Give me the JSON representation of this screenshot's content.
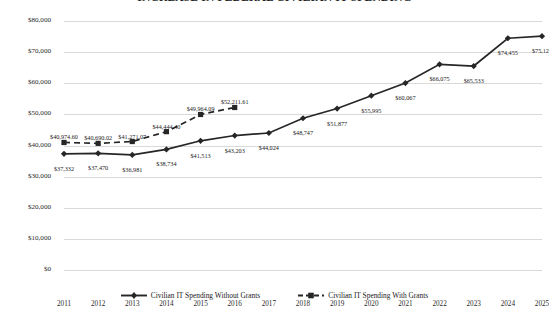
{
  "chart_data": {
    "type": "line",
    "title": "INCREASE IN FEDERAL CIVILIAN IT SPENDING",
    "xlabel": "",
    "ylabel": "",
    "grid": true,
    "legend_position": "bottom",
    "ylim": [
      0,
      80000
    ],
    "ytick_labels": [
      "$80,000",
      "$70,000",
      "$60,000",
      "$50,000",
      "$40,000",
      "$30,000",
      "$20,000",
      "$10,000",
      "$0"
    ],
    "ytick_values": [
      80000,
      70000,
      60000,
      50000,
      40000,
      30000,
      20000,
      10000,
      0
    ],
    "categories": [
      "2011",
      "2012",
      "2013",
      "2014",
      "2015",
      "2016",
      "2017",
      "2018",
      "2019",
      "2020",
      "2021",
      "2022",
      "2023",
      "2024",
      "2025"
    ],
    "series": [
      {
        "name": "Civilian IT Spending Without Grants",
        "style": "solid",
        "marker": "diamond",
        "color": "#262626",
        "values": [
          37332,
          37470,
          36981,
          38734,
          41513,
          43203,
          44024,
          48747,
          51877,
          55995,
          60067,
          66075,
          65533,
          74455,
          75128
        ],
        "labels": [
          "$37,332",
          "$37,470",
          "$36,981",
          "$38,734",
          "$41,513",
          "$43,203",
          "$44,024",
          "$48,747",
          "$51,877",
          "$55,995",
          "$60,067",
          "$66,075",
          "$65,533",
          "$74,455",
          "$75,128"
        ]
      },
      {
        "name": "Civilian IT Spending With Grants",
        "style": "dashed",
        "marker": "square",
        "color": "#262626",
        "values": [
          40974.6,
          40690.02,
          41271.07,
          44444.4,
          49964.09,
          52211.61,
          null,
          null,
          null,
          null,
          null,
          null,
          null,
          null,
          null
        ],
        "labels": [
          "$40,974.60",
          "$40,690.02",
          "$41,271.07",
          "$44,444.40",
          "$49,964.09",
          "$52,211.61",
          "",
          "",
          "",
          "",
          "",
          "",
          "",
          "",
          ""
        ]
      }
    ]
  },
  "legend": {
    "entries": [
      {
        "label": "Civilian IT Spending Without Grants"
      },
      {
        "label": "Civilian IT Spending With Grants"
      }
    ]
  }
}
